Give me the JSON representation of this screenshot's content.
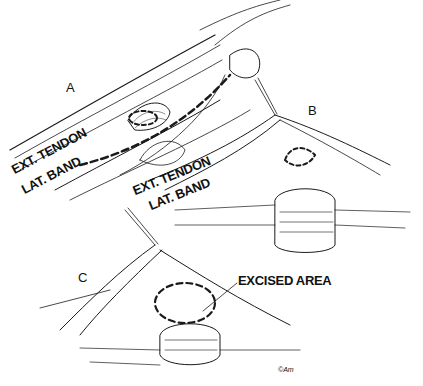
{
  "figure": {
    "panels": [
      {
        "id": "A",
        "label": "A",
        "labels": [
          "EXT. TENDON",
          "LAT. BAND"
        ]
      },
      {
        "id": "B",
        "label": "B",
        "labels": [
          "EXT. TENDON",
          "LAT. BAND"
        ]
      },
      {
        "id": "C",
        "label": "C",
        "labels": [
          "EXCISED AREA"
        ]
      }
    ],
    "signature": "©Am"
  }
}
